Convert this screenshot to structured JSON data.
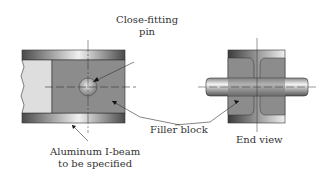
{
  "figure": {
    "labels": {
      "pin": [
        "Close-fitting",
        "pin"
      ],
      "filler": "Filler block",
      "beam": [
        "Aluminum I-beam",
        "to be specified"
      ],
      "end_view": "End view"
    },
    "colors": {
      "flange_dark": "#5a5a5a",
      "flange_light": "#e8e8e8",
      "filler": "#8c8c8c",
      "beam_end": "#dcdcdc",
      "line": "#333333"
    }
  }
}
